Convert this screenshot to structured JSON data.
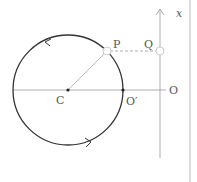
{
  "diagram": {
    "type": "circular-motion-projection",
    "labels": {
      "center": "C",
      "point_on_circle": "P",
      "projection_point": "Q",
      "circle_rightmost": "O′",
      "axis_origin": "O",
      "axis_name": "x"
    },
    "colors": {
      "circle": "#333333",
      "axis": "#999999",
      "dashed": "#999999",
      "marker_fill": "#ffffff",
      "marker_stroke": "#cccccc",
      "text": "#555555",
      "border": "#bbbbbb"
    },
    "rotation_direction": "counterclockwise"
  }
}
